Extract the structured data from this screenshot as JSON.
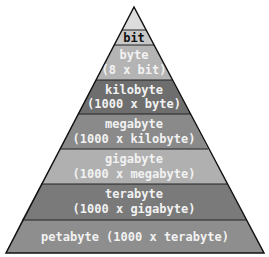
{
  "diagram": {
    "type": "pyramid",
    "levels": [
      {
        "name": "bit",
        "line1": "bit",
        "line2": "",
        "fill": "#c8c8c8",
        "text_color": "#111111"
      },
      {
        "name": "byte",
        "line1": "byte",
        "line2": "(8 x bit)",
        "fill": "#b4b4b4",
        "text_color": "#f2f2f2"
      },
      {
        "name": "kilobyte",
        "line1": "kilobyte",
        "line2": "(1000 x byte)",
        "fill": "#6e6e6e",
        "text_color": "#f2f2f2"
      },
      {
        "name": "megabyte",
        "line1": "megabyte",
        "line2": "(1000 x kilobyte)",
        "fill": "#8a8a8a",
        "text_color": "#f2f2f2"
      },
      {
        "name": "gigabyte",
        "line1": "gigabyte",
        "line2": "(1000 x megabyte)",
        "fill": "#b0b0b0",
        "text_color": "#f2f2f2"
      },
      {
        "name": "terabyte",
        "line1": "terabyte",
        "line2": "(1000 x gigabyte)",
        "fill": "#7a7a7a",
        "text_color": "#f2f2f2"
      },
      {
        "name": "petabyte",
        "line1": "petabyte (1000 x terabyte)",
        "line2": "",
        "fill": "#8e8e8e",
        "text_color": "#f2f2f2"
      }
    ]
  }
}
